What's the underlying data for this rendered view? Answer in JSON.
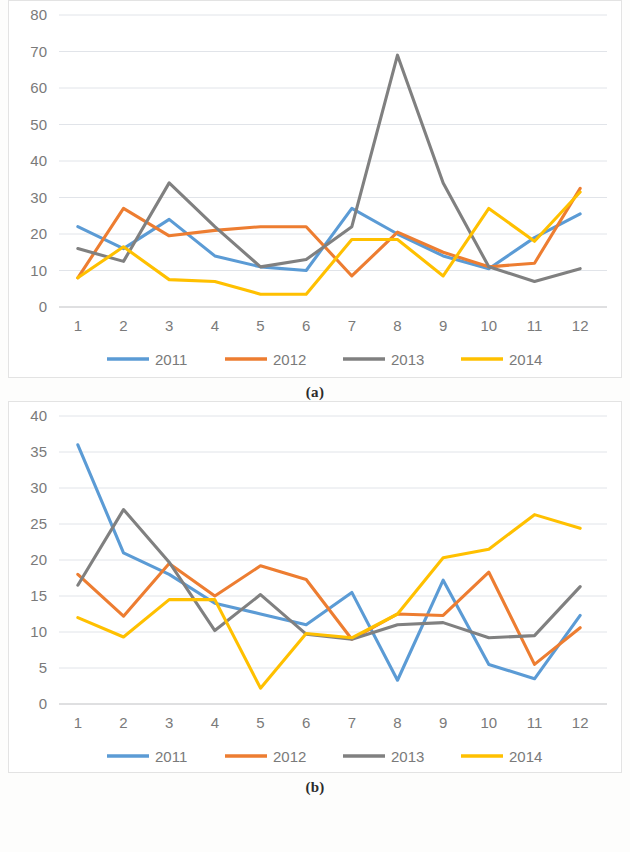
{
  "figure": {
    "panel_a_caption": "(a)",
    "panel_b_caption": "(b)"
  },
  "chart_data": [
    {
      "id": "panel-a",
      "type": "line",
      "title": "",
      "xlabel": "",
      "ylabel": "",
      "categories": [
        "1",
        "2",
        "3",
        "4",
        "5",
        "6",
        "7",
        "8",
        "9",
        "10",
        "11",
        "12"
      ],
      "xtick_labels": [
        "1",
        "2",
        "3",
        "4",
        "5",
        "6",
        "7",
        "8",
        "9",
        "10",
        "11",
        "12"
      ],
      "ytick_labels": [
        "0",
        "10",
        "20",
        "30",
        "40",
        "50",
        "60",
        "70",
        "80"
      ],
      "yticks": [
        0,
        10,
        20,
        30,
        40,
        50,
        60,
        70,
        80
      ],
      "ylim": [
        0,
        80
      ],
      "grid": true,
      "legend_position": "bottom",
      "series": [
        {
          "name": "2011",
          "color": "#5B9BD5",
          "values": [
            22.0,
            16.0,
            24.0,
            14.0,
            11.0,
            10.0,
            27.0,
            20.0,
            14.0,
            10.5,
            19.0,
            25.5
          ]
        },
        {
          "name": "2012",
          "color": "#ED7D31",
          "values": [
            8.0,
            27.0,
            19.5,
            21.0,
            22.0,
            22.0,
            8.5,
            20.5,
            15.0,
            11.0,
            12.0,
            32.5
          ]
        },
        {
          "name": "2013",
          "color": "#808080",
          "values": [
            16.0,
            12.5,
            34.0,
            22.0,
            11.0,
            13.0,
            22.0,
            69.0,
            34.0,
            11.0,
            7.0,
            10.5
          ]
        },
        {
          "name": "2014",
          "color": "#FFC000",
          "values": [
            8.0,
            16.5,
            7.5,
            7.0,
            3.5,
            3.5,
            18.5,
            18.5,
            8.5,
            27.0,
            18.0,
            31.5
          ]
        }
      ]
    },
    {
      "id": "panel-b",
      "type": "line",
      "title": "",
      "xlabel": "",
      "ylabel": "",
      "categories": [
        "1",
        "2",
        "3",
        "4",
        "5",
        "6",
        "7",
        "8",
        "9",
        "10",
        "11",
        "12"
      ],
      "xtick_labels": [
        "1",
        "2",
        "3",
        "4",
        "5",
        "6",
        "7",
        "8",
        "9",
        "10",
        "11",
        "12"
      ],
      "ytick_labels": [
        "0",
        "5",
        "10",
        "15",
        "20",
        "25",
        "30",
        "35",
        "40"
      ],
      "yticks": [
        0,
        5,
        10,
        15,
        20,
        25,
        30,
        35,
        40
      ],
      "ylim": [
        0,
        40
      ],
      "grid": true,
      "legend_position": "bottom",
      "series": [
        {
          "name": "2011",
          "color": "#5B9BD5",
          "values": [
            36.0,
            21.0,
            18.0,
            14.0,
            12.5,
            11.0,
            15.5,
            3.3,
            17.2,
            5.5,
            3.5,
            12.3
          ]
        },
        {
          "name": "2012",
          "color": "#ED7D31",
          "values": [
            18.0,
            12.2,
            19.5,
            15.0,
            19.2,
            17.3,
            9.0,
            12.5,
            12.3,
            18.3,
            5.5,
            10.6
          ]
        },
        {
          "name": "2013",
          "color": "#808080",
          "values": [
            16.5,
            27.0,
            19.7,
            10.2,
            15.2,
            9.7,
            9.0,
            11.0,
            11.3,
            9.2,
            9.5,
            16.3
          ]
        },
        {
          "name": "2014",
          "color": "#FFC000",
          "values": [
            12.0,
            9.3,
            14.5,
            14.5,
            2.2,
            9.8,
            9.2,
            12.5,
            20.3,
            21.5,
            26.3,
            24.4
          ]
        }
      ]
    }
  ],
  "legend": {
    "entries": [
      {
        "label": "2011",
        "color": "#5B9BD5"
      },
      {
        "label": "2012",
        "color": "#ED7D31"
      },
      {
        "label": "2013",
        "color": "#808080"
      },
      {
        "label": "2014",
        "color": "#FFC000"
      }
    ]
  }
}
